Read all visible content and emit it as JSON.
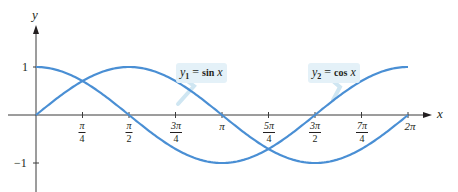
{
  "chart_data": {
    "type": "line",
    "title": "",
    "xlabel": "x",
    "ylabel": "y",
    "xlim": [
      0,
      6.2832
    ],
    "ylim": [
      -1.6,
      1.6
    ],
    "grid": false,
    "legend_position": "inline callouts",
    "x_ticks": [
      {
        "value": 0.7854,
        "num": "π",
        "den": "4"
      },
      {
        "value": 1.5708,
        "num": "π",
        "den": "2"
      },
      {
        "value": 2.3562,
        "num": "3π",
        "den": "4"
      },
      {
        "value": 3.1416,
        "label": "π"
      },
      {
        "value": 3.927,
        "num": "5π",
        "den": "4"
      },
      {
        "value": 4.7124,
        "num": "3π",
        "den": "2"
      },
      {
        "value": 5.4978,
        "num": "7π",
        "den": "4"
      },
      {
        "value": 6.2832,
        "label": "2π"
      }
    ],
    "y_ticks": [
      {
        "value": 1,
        "label": "1"
      },
      {
        "value": -1,
        "label": "−1"
      }
    ],
    "x": [
      0,
      0.7854,
      1.5708,
      2.3562,
      3.1416,
      3.927,
      4.7124,
      5.4978,
      6.2832
    ],
    "series": [
      {
        "name": "y1 = sin x",
        "function": "sin",
        "values": [
          0,
          0.707,
          1,
          0.707,
          0,
          -0.707,
          -1,
          -0.707,
          0
        ],
        "color": "#4a8fd4"
      },
      {
        "name": "y2 = cos x",
        "function": "cos",
        "values": [
          1,
          0.707,
          0,
          -0.707,
          -1,
          -0.707,
          0,
          0.707,
          1
        ],
        "color": "#4a8fd4"
      }
    ],
    "annotations": [
      {
        "text": "y1 = sin x",
        "var": "y",
        "sub": "1",
        "eq": "=",
        "fn": "sin",
        "arg": "x",
        "points_to_series": "y1 = sin x"
      },
      {
        "text": "y2 = cos x",
        "var": "y",
        "sub": "2",
        "eq": "=",
        "fn": "cos",
        "arg": "x",
        "points_to_series": "y2 = cos x"
      }
    ]
  },
  "colors": {
    "curve": "#4a8fd4",
    "axis": "#3b3b3b",
    "callout_bg": "#e4f1f8",
    "callout_leader": "#cfe6f2",
    "text": "#231f20"
  }
}
